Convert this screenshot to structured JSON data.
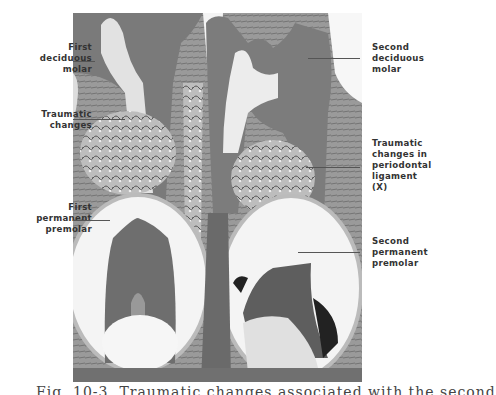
{
  "figure": {
    "type": "histological section photomicrograph",
    "labels_left": [
      {
        "id": "first-deciduous-molar",
        "lines": [
          "First",
          "deciduous",
          "molar"
        ]
      },
      {
        "id": "traumatic-changes",
        "lines": [
          "Traumatic",
          "changes"
        ]
      },
      {
        "id": "first-permanent-premolar",
        "lines": [
          "First",
          "permanent",
          "premolar"
        ]
      }
    ],
    "labels_right": [
      {
        "id": "second-deciduous-molar",
        "lines": [
          "Second",
          "deciduous",
          "molar"
        ]
      },
      {
        "id": "traumatic-changes-periodontal",
        "lines": [
          "Traumatic",
          "changes in",
          "periodontal",
          "ligament",
          "(X)"
        ]
      },
      {
        "id": "second-permanent-premolar",
        "lines": [
          "Second",
          "permanent",
          "premolar"
        ]
      }
    ],
    "caption_truncated": "Fig. 1 (caption text cut off at bottom edge)"
  },
  "colors": {
    "background": "#ffffff",
    "photo_mid": "#8a8a8a",
    "photo_dark": "#3a3a3a",
    "photo_light": "#e6e6e6",
    "label_text": "#333333",
    "leader_line": "#555555"
  }
}
